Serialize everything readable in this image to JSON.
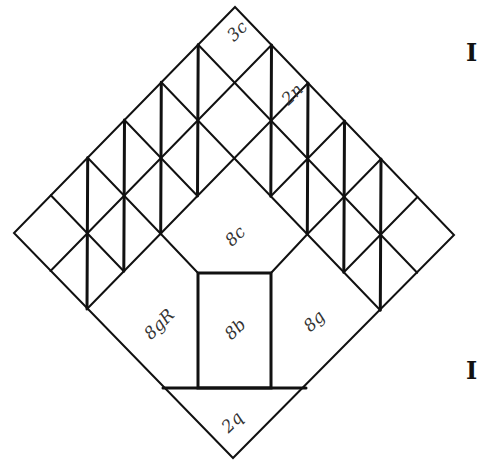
{
  "diagram": {
    "geometry": {
      "top": [
        235,
        7
      ],
      "right": [
        454,
        235
      ],
      "bottom": [
        233,
        458
      ],
      "left": [
        14,
        233
      ],
      "grid_divisions": 6
    },
    "labels": [
      {
        "id": "3c",
        "text": "3c",
        "x": 238,
        "y": 32,
        "rotate": -45
      },
      {
        "id": "2n",
        "text": "2n",
        "x": 293,
        "y": 95,
        "rotate": -45
      },
      {
        "id": "8c",
        "text": "8c",
        "x": 236,
        "y": 237,
        "rotate": -45
      },
      {
        "id": "8gR",
        "text": "8gR",
        "x": 160,
        "y": 325,
        "rotate": -45
      },
      {
        "id": "8b",
        "text": "8b",
        "x": 236,
        "y": 330,
        "rotate": -45
      },
      {
        "id": "8g",
        "text": "8g",
        "x": 315,
        "y": 322,
        "rotate": -45
      },
      {
        "id": "2q",
        "text": "2q",
        "x": 233,
        "y": 423,
        "rotate": -45
      }
    ],
    "edge_letters": [
      {
        "text": "I",
        "x": 466,
        "y": 50
      },
      {
        "text": "I",
        "x": 466,
        "y": 368
      }
    ]
  }
}
